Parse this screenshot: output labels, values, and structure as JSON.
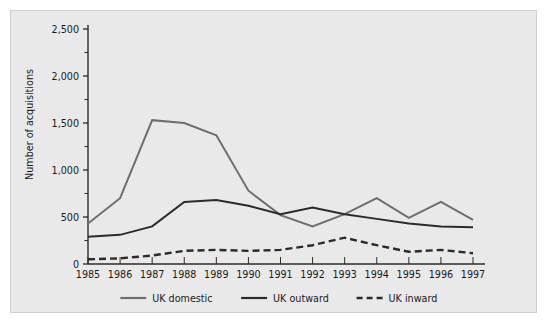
{
  "chart_data": {
    "type": "line",
    "title": "",
    "xlabel": "",
    "ylabel": "Number of acquisitions",
    "categories": [
      "1985",
      "1986",
      "1987",
      "1988",
      "1989",
      "1990",
      "1991",
      "1992",
      "1993",
      "1994",
      "1995",
      "1996",
      "1997"
    ],
    "ytick_labels": [
      "0",
      "500",
      "1,000",
      "1,500",
      "2,000",
      "2,500"
    ],
    "ytick_values": [
      0,
      500,
      1000,
      1500,
      2000,
      2500
    ],
    "ylim": [
      0,
      2500
    ],
    "minor_tick_step": 250,
    "grid": false,
    "legend_position": "bottom",
    "series": [
      {
        "name": "UK domestic",
        "style": "solid",
        "color": "#6e6e6e",
        "values": [
          430,
          700,
          1530,
          1500,
          1370,
          780,
          520,
          400,
          530,
          700,
          490,
          660,
          470
        ]
      },
      {
        "name": "UK outward",
        "style": "solid",
        "color": "#2b2b2b",
        "values": [
          290,
          310,
          400,
          660,
          680,
          620,
          530,
          600,
          530,
          480,
          430,
          400,
          390
        ]
      },
      {
        "name": "UK inward",
        "style": "dashed",
        "color": "#2b2b2b",
        "values": [
          50,
          60,
          90,
          140,
          150,
          140,
          150,
          200,
          280,
          200,
          130,
          150,
          115
        ]
      }
    ]
  },
  "legend": {
    "items": [
      {
        "label": "UK domestic",
        "style": "solid",
        "color": "#6e6e6e"
      },
      {
        "label": "UK outward",
        "style": "solid",
        "color": "#2b2b2b"
      },
      {
        "label": "UK inward",
        "style": "dashed",
        "color": "#2b2b2b"
      }
    ]
  },
  "colors": {
    "figure_background": "#e9e9e9",
    "figure_border": "#cfcfcf",
    "page_background": "#ffffff",
    "axis": "#2b2b2b",
    "text": "#1a1a1a"
  }
}
